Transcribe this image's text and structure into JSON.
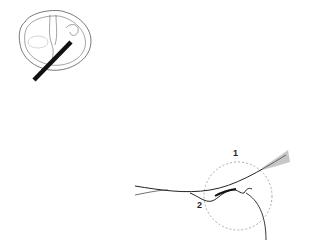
{
  "figure": {
    "kind": "anatomical line illustration",
    "panels": [
      {
        "id": "overview",
        "description": "cross-section outline with diagonal probe bar"
      },
      {
        "id": "detail",
        "description": "magnified detail with dashed circle"
      }
    ],
    "labels": [
      {
        "id": "label-1",
        "text": "1"
      },
      {
        "id": "label-2",
        "text": "2"
      }
    ],
    "colors": {
      "line": "#333333",
      "bar": "#111111",
      "dashed": "#888888",
      "background": "#ffffff"
    }
  }
}
